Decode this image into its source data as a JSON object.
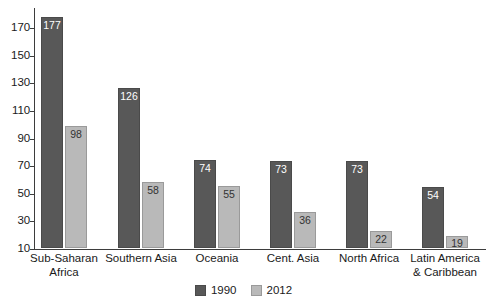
{
  "chart_data": {
    "type": "bar",
    "title": "",
    "subtitle": "",
    "xlabel": "",
    "ylabel": "",
    "ylim": [
      10,
      180
    ],
    "grid": false,
    "legend_position": "bottom-center",
    "categories": [
      "Sub-Saharan Africa",
      "Southern Asia",
      "Oceania",
      "Cent. Asia",
      "North Africa",
      "Latin America & Caribbean"
    ],
    "category_lines": [
      [
        "Sub-Saharan",
        "Africa"
      ],
      [
        "Southern Asia"
      ],
      [
        "Oceania"
      ],
      [
        "Cent. Asia"
      ],
      [
        "North Africa"
      ],
      [
        "Latin America",
        "& Caribbean"
      ]
    ],
    "series": [
      {
        "name": "1990",
        "color": "#585858",
        "values": [
          177,
          126,
          74,
          73,
          73,
          54
        ]
      },
      {
        "name": "2012",
        "color": "#b9b9b9",
        "values": [
          98,
          58,
          55,
          36,
          22,
          19
        ]
      }
    ],
    "y_ticks": [
      170,
      150,
      130,
      110,
      90,
      70,
      50,
      30,
      10
    ],
    "y_tick_labels": [
      "170",
      "150",
      "130",
      "110",
      "90",
      "70",
      "50",
      "30",
      "10"
    ],
    "value_labels": {
      "s1990": [
        "177",
        "126",
        "74",
        "73",
        "73",
        "54"
      ],
      "s2012": [
        "98",
        "58",
        "55",
        "36",
        "22",
        "19"
      ]
    }
  },
  "legend": {
    "items": [
      {
        "label": "1990",
        "swatch": "legend-swatch-1990"
      },
      {
        "label": "2012",
        "swatch": "legend-swatch-2012"
      }
    ]
  },
  "colors": {
    "series_1990": "#585858",
    "series_2012": "#b9b9b9",
    "axis": "#3d3d3d",
    "text": "#1a1a1a",
    "background": "#ffffff"
  }
}
